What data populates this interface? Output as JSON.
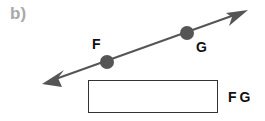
{
  "part": {
    "label": "b)"
  },
  "diagram": {
    "type": "line",
    "points": [
      {
        "name": "F",
        "cx": 107,
        "cy": 62
      },
      {
        "name": "G",
        "cx": 187,
        "cy": 33
      }
    ],
    "line_color": "#555555",
    "point_color": "#555555"
  },
  "labels": {
    "F": "F",
    "G": "G"
  },
  "answer": {
    "value": "",
    "notation": "FG"
  }
}
